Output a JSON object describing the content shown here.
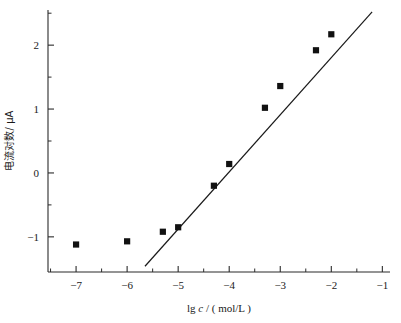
{
  "chart_data": {
    "type": "scatter",
    "title": "",
    "xlabel": "lg c / ( mol/L )",
    "xlabel_parts": {
      "prefix": "lg ",
      "italic_symbol": "c",
      "suffix": " / ( mol/L )"
    },
    "ylabel": "电流对数/ μA",
    "ylabel_parts": {
      "cjk": "电流对数",
      "unit": "/ μA"
    },
    "xlim": [
      -7.55,
      -0.85
    ],
    "ylim": [
      -1.55,
      2.55
    ],
    "xticks": [
      -7,
      -6,
      -5,
      -4,
      -3,
      -2,
      -1
    ],
    "xtick_labels": [
      "−7",
      "−6",
      "−5",
      "−4",
      "−3",
      "−2",
      "−1"
    ],
    "xminor_ticks": [
      -7.5,
      -6.5,
      -5.5,
      -4.5,
      -3.5,
      -2.5,
      -1.5
    ],
    "yticks": [
      -1,
      0,
      1,
      2
    ],
    "ytick_labels": [
      "−1",
      "0",
      "1",
      "2"
    ],
    "yminor_ticks": [
      -0.5,
      0.5,
      1.5,
      2.5
    ],
    "grid": false,
    "legend": null,
    "marker_style": "filled-square",
    "marker_color": "#111111",
    "line_color": "#1a1a1a",
    "x": [
      -7.0,
      -6.0,
      -5.3,
      -5.0,
      -4.3,
      -4.0,
      -3.3,
      -3.0,
      -2.3,
      -2.0
    ],
    "y": [
      -1.12,
      -1.07,
      -0.92,
      -0.85,
      -0.2,
      0.14,
      1.02,
      1.36,
      1.92,
      2.17
    ],
    "points": [
      {
        "x": -7.0,
        "y": -1.12
      },
      {
        "x": -6.0,
        "y": -1.07
      },
      {
        "x": -5.3,
        "y": -0.92
      },
      {
        "x": -5.0,
        "y": -0.85
      },
      {
        "x": -4.3,
        "y": -0.2
      },
      {
        "x": -4.0,
        "y": 0.14
      },
      {
        "x": -3.3,
        "y": 1.02
      },
      {
        "x": -3.0,
        "y": 1.36
      },
      {
        "x": -2.3,
        "y": 1.92
      },
      {
        "x": -2.0,
        "y": 2.17
      }
    ],
    "fit_line": {
      "x_start": -5.65,
      "y_start": -1.46,
      "x_end": -1.2,
      "y_end": 2.52
    }
  }
}
